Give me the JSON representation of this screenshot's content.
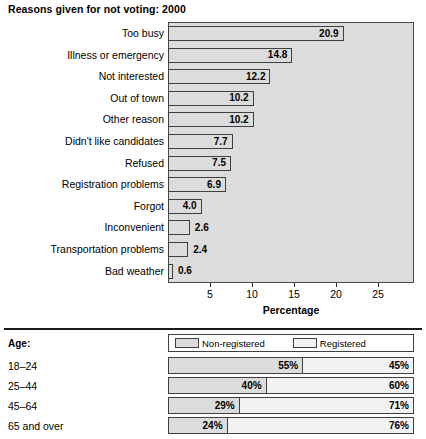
{
  "chart_data": [
    {
      "type": "bar",
      "title": "Reasons given for not voting: 2000",
      "xlabel": "Percentage",
      "ylabel": "",
      "orientation": "horizontal",
      "xlim": [
        0,
        29.3
      ],
      "ticks": [
        5,
        10,
        15,
        20,
        25
      ],
      "grid": false,
      "categories": [
        "Too busy",
        "Illness or emergency",
        "Not interested",
        "Out of town",
        "Other reason",
        "Didn't like candidates",
        "Refused",
        "Registration problems",
        "Forgot",
        "Inconvenient",
        "Transportation problems",
        "Bad weather"
      ],
      "values": [
        20.9,
        14.8,
        12.2,
        10.2,
        10.2,
        7.7,
        7.5,
        6.9,
        4.0,
        2.6,
        2.4,
        0.6
      ],
      "value_labels": [
        "20.9",
        "14.8",
        "12.2",
        "10.2",
        "10.2",
        "7.7",
        "7.5",
        "6.9",
        "4.0",
        "2.6",
        "2.4",
        "0.6"
      ],
      "label_inside": [
        true,
        true,
        true,
        true,
        true,
        true,
        true,
        true,
        true,
        false,
        false,
        false
      ]
    },
    {
      "type": "bar",
      "subtype": "stacked-100",
      "title": "",
      "row_header": "Age:",
      "legend": [
        "Non-registered",
        "Registered"
      ],
      "legend_position": "top",
      "categories": [
        "18–24",
        "25–44",
        "45–64",
        "65 and over"
      ],
      "series": [
        {
          "name": "Non-registered",
          "values": [
            55,
            40,
            29,
            24
          ],
          "labels": [
            "55%",
            "40%",
            "29%",
            "24%"
          ]
        },
        {
          "name": "Registered",
          "values": [
            45,
            60,
            71,
            76
          ],
          "labels": [
            "45%",
            "60%",
            "71%",
            "76%"
          ]
        }
      ]
    }
  ],
  "colors": {
    "plot_background": "#dcdcdc",
    "bar_fill": "#dcdcdc",
    "registered_fill": "#f2f2f2",
    "outline": "#3f3f3f",
    "text": "#000000"
  }
}
